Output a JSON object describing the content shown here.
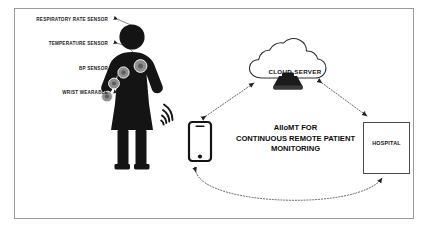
{
  "sensor_labels": [
    {
      "text": "RESPIRATORY RATE SENSOR"
    },
    {
      "text": "TEMPERATURE SENSOR"
    },
    {
      "text": "BP SENSOR"
    },
    {
      "text": "WRIST WEARABLE"
    }
  ],
  "cloud": {
    "label": "CLOUD SERVER",
    "icon": "server-icon"
  },
  "center": {
    "line1": "AIIoMT FOR",
    "line2": "CONTINUOUS REMOTE PATIENT",
    "line3": "MONITORING"
  },
  "hospital": {
    "label": "HOSPITAL",
    "cross_icon": "medical-cross-icon",
    "doctor_icon": "doctor-icon"
  },
  "phone": {
    "icon": "smartphone-icon"
  },
  "wireless": {
    "icon": "wireless-signal-icon"
  },
  "patient": {
    "icon": "female-patient-icon"
  },
  "colors": {
    "silhouette": "#141414",
    "sensor_fill": "#8c8c8c",
    "frame_border": "#9a9a9a",
    "arrow": "#2b2b2b",
    "text": "#111111",
    "background": "#ffffff"
  }
}
